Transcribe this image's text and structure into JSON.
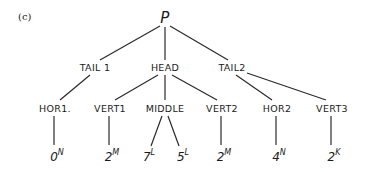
{
  "panel_label": "(c)",
  "root": {
    "label": "P",
    "x": 165,
    "y": 18
  },
  "level1": [
    {
      "label": "TAIL 1",
      "x": 95,
      "y": 67
    },
    {
      "label": "HEAD",
      "x": 165,
      "y": 67
    },
    {
      "label": "TAIL2",
      "x": 232,
      "y": 67
    }
  ],
  "level2": [
    {
      "label": "HOR1.",
      "x": 55,
      "y": 108,
      "parent": 0
    },
    {
      "label": "VERT1",
      "x": 110,
      "y": 108,
      "parent": 1
    },
    {
      "label": "MIDDLE",
      "x": 165,
      "y": 108,
      "parent": 1
    },
    {
      "label": "VERT2",
      "x": 222,
      "y": 108,
      "parent": 1
    },
    {
      "label": "HOR2",
      "x": 277,
      "y": 108,
      "parent": 2
    },
    {
      "label": "VERT3",
      "x": 332,
      "y": 108,
      "parent": 2
    }
  ],
  "leaves": [
    {
      "value": "0",
      "sup": "N",
      "x": 55,
      "y": 156
    },
    {
      "value": "2",
      "sup": "M",
      "x": 110,
      "y": 156
    },
    {
      "value": "7",
      "sup": "L",
      "x": 147,
      "y": 156
    },
    {
      "value": "5",
      "sup": "L",
      "x": 183,
      "y": 156
    },
    {
      "value": "2",
      "sup": "M",
      "x": 222,
      "y": 156
    },
    {
      "value": "4",
      "sup": "N",
      "x": 277,
      "y": 156
    },
    {
      "value": "2",
      "sup": "K",
      "x": 332,
      "y": 156
    }
  ]
}
